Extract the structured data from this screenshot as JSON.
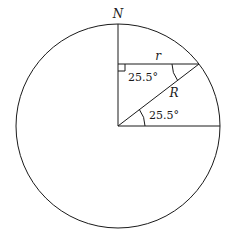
{
  "diagram": {
    "type": "geometry",
    "labels": {
      "north": "N",
      "small_radius": "r",
      "big_radius": "R",
      "angle_top": "25.5°",
      "angle_bottom": "25.5°"
    },
    "colors": {
      "line": "#1a1a1a",
      "background": "#ffffff"
    }
  }
}
